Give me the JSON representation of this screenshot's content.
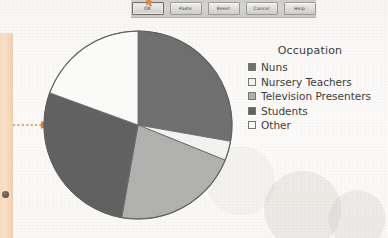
{
  "page": {
    "background_color": "#fbfaf8",
    "margin_band_color": "#f6d9bd",
    "annotation_color": "#e08a3c"
  },
  "dialog_bar": {
    "name": "cropped-dialog-button-bar",
    "buttons": [
      {
        "label": "OK",
        "default": true
      },
      {
        "label": "Paste",
        "default": false
      },
      {
        "label": "Reset",
        "default": false
      },
      {
        "label": "Cancel",
        "default": false
      },
      {
        "label": "Help",
        "default": false
      }
    ]
  },
  "annotation": {
    "arrow_label": "",
    "style": "dashed-arrow-pointing-right",
    "color": "#e08a3c"
  },
  "legend": {
    "title": "Occupation",
    "items": [
      {
        "label": "Nuns",
        "color": "#6f6f6f"
      },
      {
        "label": "Nursery Teachers",
        "color": "#f2f2f0"
      },
      {
        "label": "Television Presenters",
        "color": "#b0b0ae"
      },
      {
        "label": "Students",
        "color": "#616161"
      },
      {
        "label": "Other",
        "color": "#fafaf8"
      }
    ]
  },
  "chart_data": {
    "type": "pie",
    "title": "Occupation",
    "legend_position": "right",
    "start_angle_deg": 0,
    "direction": "clockwise",
    "categories": [
      "Nuns",
      "Nursery Teachers",
      "Television Presenters",
      "Students",
      "Other"
    ],
    "values": [
      27.8,
      3.3,
      21.7,
      27.8,
      19.4
    ],
    "unit": "percent",
    "angles_deg": [
      100,
      12,
      78,
      100,
      70
    ],
    "colors": [
      "#6f6f6f",
      "#f2f2f0",
      "#b0b0ae",
      "#616161",
      "#fafaf8"
    ],
    "slice_border_color": "#6b6b6b",
    "center_x": 98,
    "center_y": 98,
    "radius": 94,
    "xlabel": "",
    "ylabel": "",
    "grid": false
  }
}
